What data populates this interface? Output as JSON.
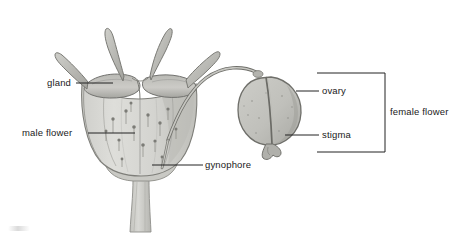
{
  "figure": {
    "kind": "botanical-illustration",
    "background_color": "#ffffff",
    "ink_color": "#4a4a4a",
    "fill_light": "#d9d9d6",
    "fill_mid": "#c2c2bd",
    "fill_dark": "#a8a8a3",
    "label_color": "#1a1a1a",
    "leader_color": "#222222"
  },
  "labels": {
    "gland": "gland",
    "male_flower": "male flower",
    "gynophore": "gynophore",
    "ovary": "ovary",
    "stigma": "stigma",
    "female_flower": "female flower"
  },
  "bracket": {
    "label": "female flower",
    "groups": [
      "ovary",
      "stigma"
    ]
  },
  "parts": [
    {
      "name": "horn-appendage",
      "count": 4,
      "position": "apex of cup"
    },
    {
      "name": "gland",
      "count": 2,
      "position": "rim of cup"
    },
    {
      "name": "male-flower-cup",
      "count": 1,
      "position": "left, central"
    },
    {
      "name": "stamen-speckle",
      "count": 14,
      "position": "inside cup"
    },
    {
      "name": "gynophore-stalk",
      "count": 1,
      "position": "arching to the right"
    },
    {
      "name": "ovary",
      "count": 1,
      "position": "right"
    },
    {
      "name": "stigma",
      "count": 1,
      "position": "below ovary"
    },
    {
      "name": "pedicel-stem",
      "count": 1,
      "position": "below cup"
    }
  ]
}
